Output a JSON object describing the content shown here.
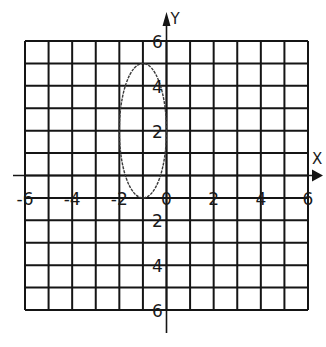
{
  "chart_data": {
    "type": "line",
    "title": "",
    "xlabel": "X",
    "ylabel": "Y",
    "xlim": [
      -6,
      6
    ],
    "ylim": [
      -6,
      6
    ],
    "grid": true,
    "grid_columns": 12,
    "grid_rows": 12,
    "x_ticks": [
      {
        "value": -6,
        "label": "-6"
      },
      {
        "value": -4,
        "label": "-4"
      },
      {
        "value": -2,
        "label": "-2"
      },
      {
        "value": 0,
        "label": "0"
      },
      {
        "value": 2,
        "label": "2"
      },
      {
        "value": 4,
        "label": "4"
      },
      {
        "value": 6,
        "label": "6"
      }
    ],
    "y_ticks_upper": [
      {
        "row": 0,
        "label": "6"
      },
      {
        "row": 2,
        "label": "4"
      },
      {
        "row": 4,
        "label": "2"
      }
    ],
    "y_ticks_lower": [
      {
        "row": 8,
        "label": "2"
      },
      {
        "row": 10,
        "label": "4"
      },
      {
        "row": 12,
        "label": "6"
      }
    ],
    "ellipse": {
      "center_x": -1,
      "center_row": 4,
      "radius_x": 1,
      "radius_rows": 3
    },
    "x_axis_row": 6,
    "tick_label_row": 7,
    "series": [
      {
        "name": "ellipse",
        "shape": "ellipse",
        "center": [
          -1,
          2
        ],
        "rx": 1,
        "ry": 3
      }
    ]
  }
}
